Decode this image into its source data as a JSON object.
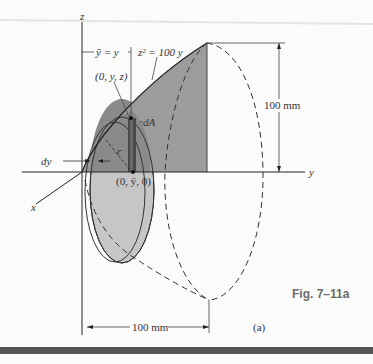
{
  "figure": {
    "caption": "Fig. 7–11a",
    "sublabel": "(a)",
    "axes": {
      "z": "z",
      "y": "y",
      "x": "x"
    },
    "labels": {
      "centroid_relation": "ỹ = y",
      "curve_equation": "z² = 100 y",
      "point_top": "(0, y, z)",
      "element": "dA",
      "thickness": "dy",
      "radius": "r",
      "point_bottom": "(0, ȳ, 0)"
    },
    "dimensions": {
      "height": "100 mm",
      "length": "100 mm"
    },
    "colors": {
      "shaded_region": "#9a9a9a",
      "disk_fill": "#c4c4c4",
      "strip": "#4a4a4a",
      "caption": "#6b6b6b",
      "bottom_bar": "#555555"
    }
  }
}
